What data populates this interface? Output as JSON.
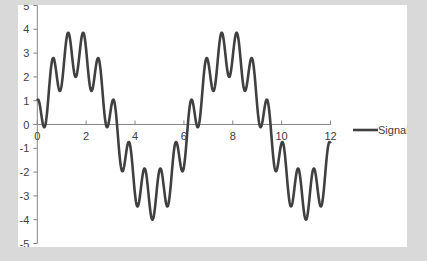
{
  "chart_data": {
    "type": "line",
    "title": "",
    "xlabel": "",
    "ylabel": "",
    "xlim": [
      0,
      12
    ],
    "ylim": [
      -5,
      5
    ],
    "x_ticks": [
      0,
      2,
      4,
      6,
      8,
      10,
      12
    ],
    "y_ticks": [
      5,
      4,
      3,
      2,
      1,
      0,
      -1,
      -2,
      -3,
      -4,
      -5
    ],
    "grid": false,
    "legend_position": "right",
    "series": [
      {
        "name": "Signal",
        "color": "#404040",
        "formula": "3*sin(x) + cos(10*x)",
        "x": [
          0,
          0.5,
          1,
          1.5,
          2,
          2.5,
          3,
          3.5,
          4,
          4.5,
          5,
          5.5,
          6,
          6.5,
          7,
          7.5,
          8,
          8.5,
          9,
          9.5,
          10,
          10.5,
          11,
          11.5,
          12
        ],
        "values": [
          1.0,
          1.72,
          1.68,
          1.64,
          3.14,
          2.8,
          -0.12,
          -0.1,
          -2.94,
          -3.85,
          -2.62,
          -2.84,
          -1.79,
          -0.11,
          2.6,
          3.73,
          2.08,
          3.64,
          0.75,
          -1.25,
          -2.49,
          -1.89,
          -2.33,
          -1.74,
          -0.8
        ]
      }
    ]
  },
  "legend": {
    "label": "Signal"
  },
  "colors": {
    "background": "#d9d9d9",
    "plot": "#ffffff",
    "axis": "#868686",
    "line": "#404040"
  }
}
